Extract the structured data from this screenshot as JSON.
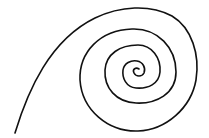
{
  "figure": {
    "type": "spiral",
    "stroke_color": "#111111",
    "background_color": "#ffffff",
    "turns": 4,
    "center": [
      137,
      72
    ],
    "tail_end": [
      15,
      132
    ]
  }
}
